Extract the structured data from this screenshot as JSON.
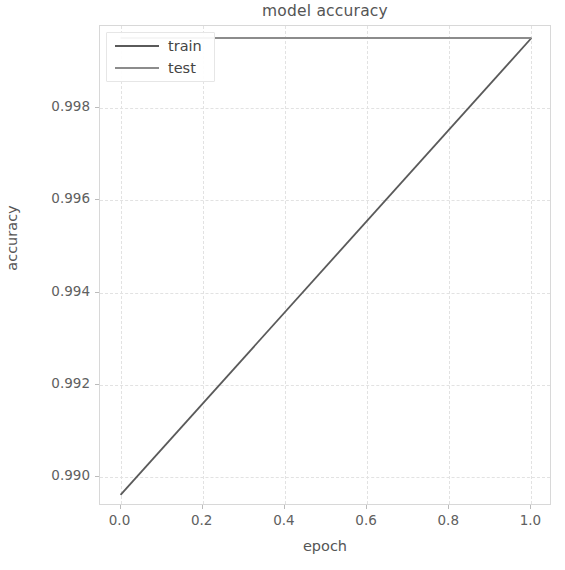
{
  "chart_data": {
    "type": "line",
    "title": "model accuracy",
    "xlabel": "epoch",
    "ylabel": "accuracy",
    "xlim": [
      -0.05,
      1.05
    ],
    "ylim": [
      0.98938,
      0.99978
    ],
    "grid": true,
    "legend_position": "upper left",
    "xticks": [
      0.0,
      0.2,
      0.4,
      0.6,
      0.8,
      1.0
    ],
    "xtick_labels": [
      "0.0",
      "0.2",
      "0.4",
      "0.6",
      "0.8",
      "1.0"
    ],
    "yticks": [
      0.99,
      0.992,
      0.994,
      0.996,
      0.998
    ],
    "ytick_labels": [
      "0.990",
      "0.992",
      "0.994",
      "0.996",
      "0.998"
    ],
    "x": [
      0.0,
      1.0
    ],
    "series": [
      {
        "name": "train",
        "color": "#5a5a5a",
        "values": [
          0.98962,
          0.99952
        ]
      },
      {
        "name": "test",
        "color": "#8c8c8c",
        "values": [
          0.99952,
          0.99952
        ]
      }
    ]
  },
  "legend": {
    "entries": [
      {
        "label": "train"
      },
      {
        "label": "test"
      }
    ]
  },
  "colors": {
    "train_line": "#5a5a5a",
    "test_line": "#8c8c8c",
    "grid": "#e2e2e2",
    "axis": "#d8d8d8",
    "text": "#555555",
    "background": "#ffffff"
  }
}
